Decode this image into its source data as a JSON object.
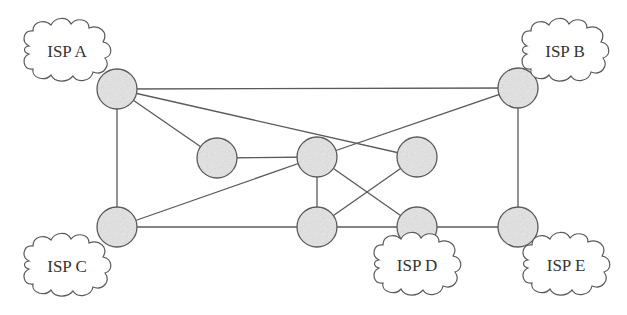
{
  "diagram": {
    "type": "network-topology",
    "colors": {
      "edge": "#5a5a5a",
      "node_fill": "#e2e2e2",
      "node_stroke": "#5a5a5a",
      "cloud_fill": "#ffffff",
      "text": "#333333"
    },
    "nodes": [
      {
        "id": "A",
        "x": 117,
        "y": 89
      },
      {
        "id": "B",
        "x": 518,
        "y": 88
      },
      {
        "id": "ML",
        "x": 217,
        "y": 158
      },
      {
        "id": "CTR",
        "x": 317,
        "y": 157
      },
      {
        "id": "MR",
        "x": 417,
        "y": 157
      },
      {
        "id": "C",
        "x": 117,
        "y": 227
      },
      {
        "id": "BC",
        "x": 317,
        "y": 227
      },
      {
        "id": "D",
        "x": 417,
        "y": 227
      },
      {
        "id": "E",
        "x": 518,
        "y": 227
      }
    ],
    "edges": [
      [
        "A",
        "B"
      ],
      [
        "A",
        "C"
      ],
      [
        "A",
        "ML"
      ],
      [
        "A",
        "MR"
      ],
      [
        "B",
        "CTR"
      ],
      [
        "B",
        "E"
      ],
      [
        "ML",
        "CTR"
      ],
      [
        "C",
        "CTR"
      ],
      [
        "C",
        "BC"
      ],
      [
        "BC",
        "D"
      ],
      [
        "D",
        "E"
      ],
      [
        "CTR",
        "BC"
      ],
      [
        "CTR",
        "D"
      ],
      [
        "MR",
        "BC"
      ]
    ],
    "clouds": [
      {
        "id": "isp-a",
        "label": "ISP A",
        "x": 67,
        "y": 50,
        "attached_to": "A"
      },
      {
        "id": "isp-b",
        "label": "ISP B",
        "x": 565,
        "y": 50,
        "attached_to": "B"
      },
      {
        "id": "isp-c",
        "label": "ISP C",
        "x": 67,
        "y": 265,
        "attached_to": "C"
      },
      {
        "id": "isp-d",
        "label": "ISP D",
        "x": 417,
        "y": 264,
        "attached_to": "D"
      },
      {
        "id": "isp-e",
        "label": "ISP E",
        "x": 566,
        "y": 264,
        "attached_to": "E"
      }
    ]
  }
}
